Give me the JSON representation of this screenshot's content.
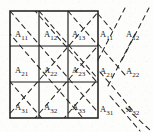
{
  "figure": {
    "type": "block-matrix-partition-diagram",
    "background_color": "#fdfdfb",
    "ink_color": "#232323",
    "grid": {
      "rows": 3,
      "cols": 3,
      "x": 10,
      "y": 11,
      "width": 88,
      "height": 107,
      "border_style": "solid",
      "cell_labels": [
        [
          {
            "base": "A",
            "sub": "11"
          },
          {
            "base": "A",
            "sub": "12"
          },
          {
            "base": "A",
            "sub": "13"
          }
        ],
        [
          {
            "base": "A",
            "sub": "21"
          },
          {
            "base": "A",
            "sub": "22"
          },
          {
            "base": "A",
            "sub": "23"
          }
        ],
        [
          {
            "base": "A",
            "sub": "31"
          },
          {
            "base": "A",
            "sub": "32"
          },
          {
            "base": "A",
            "sub": "33"
          }
        ]
      ]
    },
    "outside_labels": [
      {
        "base": "A",
        "sub": "11",
        "x": 103,
        "y": 28
      },
      {
        "base": "A",
        "sub": "12",
        "x": 128,
        "y": 28
      },
      {
        "base": "A",
        "sub": "21",
        "x": 103,
        "y": 66
      },
      {
        "base": "A",
        "sub": "22",
        "x": 128,
        "y": 66
      },
      {
        "base": "A",
        "sub": "31",
        "x": 103,
        "y": 104
      },
      {
        "base": "A",
        "sub": "32",
        "x": 128,
        "y": 104
      }
    ],
    "diagonals": {
      "style": "dashed",
      "dash_pattern": "5 4",
      "down_right_count": 9,
      "up_right_count": 5,
      "color": "#2a2a2a"
    }
  }
}
